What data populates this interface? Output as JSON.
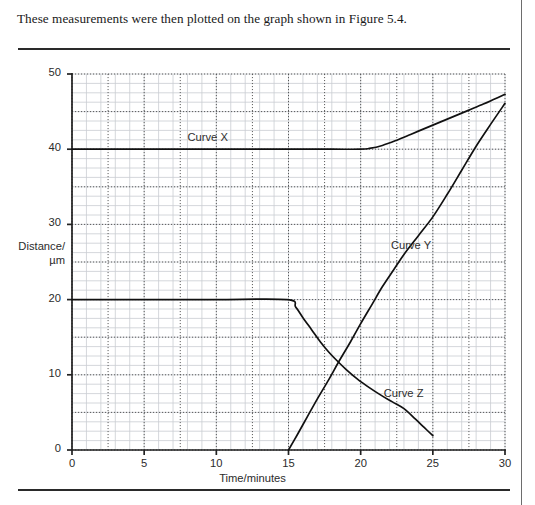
{
  "caption": "These measurements were then plotted on the graph shown in Figure 5.4.",
  "colors": {
    "ink": "#1a1a1a",
    "curve": "#111111",
    "minor_grid": "#c9cdd2",
    "major_grid": "#4a4a4a",
    "axis": "#222222",
    "rule": "#2a2a2a"
  },
  "chart_data": {
    "type": "line",
    "title": "",
    "xlabel": "Time/minutes",
    "ylabel": "Distance/µm",
    "ylabel_lines": [
      "Distance/",
      "µm"
    ],
    "xlim": [
      0,
      30
    ],
    "ylim": [
      0,
      50
    ],
    "xticks": [
      0,
      5,
      10,
      15,
      20,
      25,
      30
    ],
    "yticks": [
      0,
      10,
      20,
      30,
      40,
      50
    ],
    "xtick_labels": [
      "0",
      "5",
      "10",
      "15",
      "20",
      "25",
      "30"
    ],
    "ytick_labels": [
      "0",
      "10",
      "20",
      "30",
      "40",
      "50"
    ],
    "grid": true,
    "grid_minor_step_x": 1,
    "grid_minor_step_y": 1.25,
    "grid_major_step_x": 2.5,
    "grid_major_step_y": 5,
    "legend": "inline-labels",
    "annotations": [
      {
        "text": "Curve X",
        "x": 8.0,
        "y": 41.3
      },
      {
        "text": "Curve Y",
        "x": 22.1,
        "y": 27.0
      },
      {
        "text": "Curve Z",
        "x": 21.6,
        "y": 7.3
      }
    ],
    "series": [
      {
        "name": "Curve X",
        "label": "Curve X",
        "points": [
          [
            0,
            40
          ],
          [
            5,
            40
          ],
          [
            10,
            40
          ],
          [
            15,
            40
          ],
          [
            18,
            40
          ],
          [
            20,
            40
          ],
          [
            20.6,
            40.1
          ],
          [
            21.5,
            40.5
          ],
          [
            22.5,
            41.2
          ],
          [
            23.5,
            42.0
          ],
          [
            24.5,
            42.8
          ],
          [
            25.5,
            43.6
          ],
          [
            26.5,
            44.4
          ],
          [
            27.5,
            45.2
          ],
          [
            28.5,
            46.0
          ],
          [
            29.2,
            46.6
          ],
          [
            30,
            47.3
          ]
        ]
      },
      {
        "name": "Curve Y",
        "label": "Curve Y",
        "points": [
          [
            15,
            0
          ],
          [
            15.6,
            2.0
          ],
          [
            16.3,
            4.4
          ],
          [
            17,
            6.8
          ],
          [
            17.8,
            9.4
          ],
          [
            18.5,
            11.8
          ],
          [
            19.3,
            14.4
          ],
          [
            20,
            16.8
          ],
          [
            20.8,
            19.4
          ],
          [
            21.5,
            21.7
          ],
          [
            22.3,
            24.0
          ],
          [
            23,
            26.0
          ],
          [
            24,
            28.5
          ],
          [
            25,
            31.0
          ],
          [
            26,
            34.0
          ],
          [
            27,
            37.2
          ],
          [
            28,
            40.4
          ],
          [
            29,
            43.3
          ],
          [
            30,
            46.1
          ]
        ]
      },
      {
        "name": "Curve Z",
        "label": "Curve Z",
        "points": [
          [
            0,
            20
          ],
          [
            5,
            20
          ],
          [
            10,
            20
          ],
          [
            14.9,
            20
          ],
          [
            15.5,
            19.0
          ],
          [
            16,
            17.6
          ],
          [
            16.6,
            16.0
          ],
          [
            17.2,
            14.4
          ],
          [
            17.8,
            13.0
          ],
          [
            18.4,
            11.8
          ],
          [
            19,
            10.7
          ],
          [
            19.8,
            9.4
          ],
          [
            20.6,
            8.3
          ],
          [
            21.4,
            7.3
          ],
          [
            22.2,
            6.4
          ],
          [
            23,
            5.5
          ],
          [
            23.8,
            4.1
          ],
          [
            24.4,
            3.0
          ],
          [
            25,
            1.9
          ]
        ]
      }
    ]
  }
}
